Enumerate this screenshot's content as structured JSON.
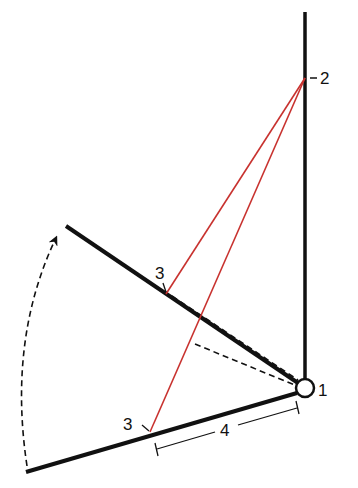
{
  "diagram": {
    "colors": {
      "line": "#111111",
      "red": "#c8322f",
      "background": "#ffffff"
    },
    "labels": {
      "pivot": "1",
      "top_point": "2",
      "upper_arm_point": "3",
      "lower_arm_point": "3",
      "distance": "4"
    },
    "elements": {
      "vertical_bar": "vertical line from pivot through point 2",
      "upper_arm": "rotated arm (upper position)",
      "lower_arm": "arm (lower position)",
      "rotation_arrow": "dashed curved arrow indicating rotation from lower to upper position",
      "red_lines": "lines from point 2 to each point 3",
      "dashed_lines": "dashed reference lines to pivot",
      "dimension": "distance 4 between point 3 and pivot on lower arm"
    }
  }
}
